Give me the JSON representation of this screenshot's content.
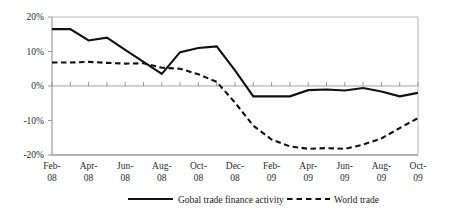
{
  "chart_data": {
    "type": "line",
    "title": "",
    "xlabel": "",
    "ylabel": "",
    "ylim": [
      -20,
      20
    ],
    "yticks": [
      20,
      10,
      0,
      -10,
      -20
    ],
    "ytick_labels": [
      "20%",
      "10%",
      "0%",
      "-10%",
      "-20%"
    ],
    "grid": false,
    "legend_position": "bottom",
    "x": [
      "Feb-08",
      "Mar-08",
      "Apr-08",
      "May-08",
      "Jun-08",
      "Jul-08",
      "Aug-08",
      "Sep-08",
      "Oct-08",
      "Nov-08",
      "Dec-08",
      "Jan-09",
      "Feb-09",
      "Mar-09",
      "Apr-09",
      "May-09",
      "Jun-09",
      "Jul-09",
      "Aug-09",
      "Sep-09",
      "Oct-09"
    ],
    "xtick_labels": [
      "Feb-\n08",
      "Apr-\n08",
      "Jun-\n08",
      "Aug-\n08",
      "Oct-\n08",
      "Dec-\n08",
      "Feb-\n09",
      "Apr-\n09",
      "Jun-\n09",
      "Aug-\n09",
      "Oct-\n09"
    ],
    "xtick_labels_line1": [
      "Feb-",
      "Apr-",
      "Jun-",
      "Aug-",
      "Oct-",
      "Dec-",
      "Feb-",
      "Apr-",
      "Jun-",
      "Aug-",
      "Oct-"
    ],
    "xtick_labels_line2": [
      "08",
      "08",
      "08",
      "08",
      "08",
      "08",
      "09",
      "09",
      "09",
      "09",
      "09"
    ],
    "series": [
      {
        "name": "Gobal trade finance activity",
        "style": "solid",
        "color": "#111111",
        "values": [
          16.5,
          16.5,
          13.2,
          14.0,
          10.5,
          7.0,
          3.5,
          9.8,
          11.0,
          11.5,
          4.5,
          -3.0,
          -3.0,
          -3.0,
          -1.2,
          -1.0,
          -1.3,
          -0.6,
          -1.6,
          -3.0,
          -2.0
        ]
      },
      {
        "name": "World trade",
        "style": "dashed",
        "color": "#111111",
        "values": [
          6.8,
          6.8,
          7.0,
          6.7,
          6.5,
          6.6,
          5.3,
          5.0,
          3.4,
          1.2,
          -4.8,
          -11.5,
          -15.5,
          -17.5,
          -18.2,
          -18.0,
          -18.2,
          -17.0,
          -15.2,
          -12.2,
          -9.3
        ]
      }
    ]
  },
  "legend": {
    "items": [
      {
        "label": "Gobal trade finance activity",
        "style": "solid"
      },
      {
        "label": "World trade",
        "style": "dashed"
      }
    ]
  }
}
